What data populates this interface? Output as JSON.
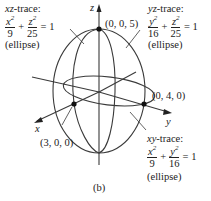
{
  "figure": {
    "caption": "(b)",
    "axes": {
      "x": "x",
      "y": "y",
      "z": "z"
    },
    "points": [
      {
        "label": "(0, 0, 5)"
      },
      {
        "label": "(0, 4, 0)"
      },
      {
        "label": "(3, 0, 0)"
      }
    ],
    "traces": {
      "xz": {
        "title": "xz-trace:",
        "num1": "x",
        "den1": "9",
        "num2": "z",
        "den2": "25",
        "rhs": "= 1",
        "plus": "+",
        "kind": "(ellipse)"
      },
      "yz": {
        "title": "yz-trace:",
        "num1": "y",
        "den1": "16",
        "num2": "z",
        "den2": "25",
        "rhs": "= 1",
        "plus": "+",
        "kind": "(ellipse)"
      },
      "xy": {
        "title": "xy-trace:",
        "num1": "x",
        "den1": "9",
        "num2": "y",
        "den2": "16",
        "rhs": "= 1",
        "plus": "+",
        "kind": "(ellipse)"
      }
    },
    "colors": {
      "line": "#333333",
      "point": "#111111"
    }
  }
}
